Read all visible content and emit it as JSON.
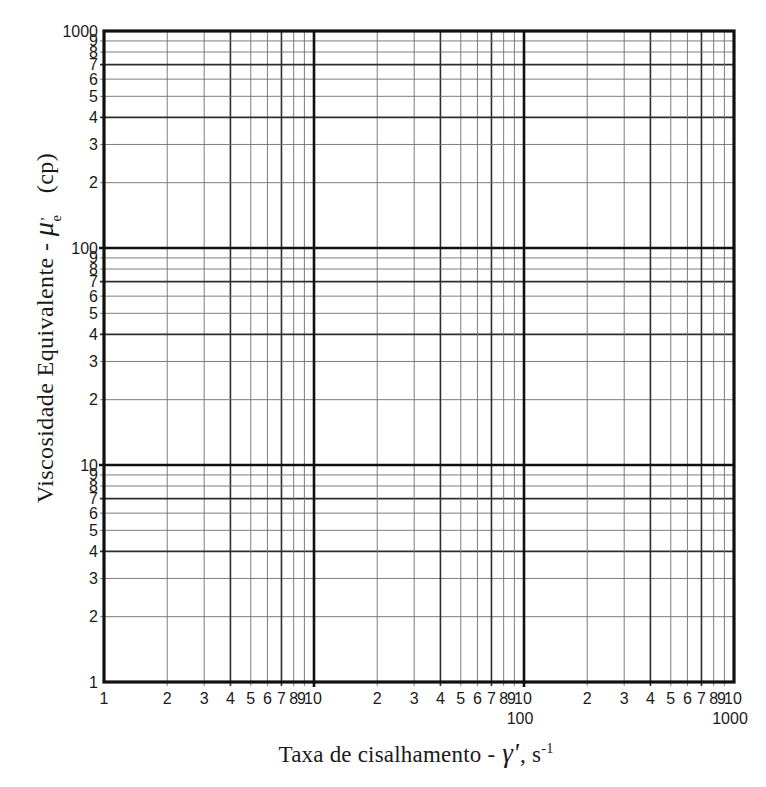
{
  "chart_data": {
    "type": "line",
    "title": "",
    "series": [],
    "x_axis": {
      "label_text": "Taxa de cisalhamento - ",
      "label_symbol": "γ'",
      "label_unit_base": ", s",
      "label_unit_exp": "-1",
      "scale": "log",
      "min": 1,
      "max": 1000,
      "decades": [
        1,
        10,
        100,
        1000
      ],
      "ticks": [
        {
          "label": "1",
          "value": 1
        },
        {
          "label": "2",
          "value": 2
        },
        {
          "label": "3",
          "value": 3
        },
        {
          "label": "4",
          "value": 4
        },
        {
          "label": "5",
          "value": 5
        },
        {
          "label": "6",
          "value": 6
        },
        {
          "label": "7",
          "value": 7
        },
        {
          "label": "8",
          "value": 8
        },
        {
          "label": "9",
          "value": 9
        },
        {
          "label": "10",
          "value": 10
        },
        {
          "label": "2",
          "value": 20
        },
        {
          "label": "3",
          "value": 30
        },
        {
          "label": "4",
          "value": 40
        },
        {
          "label": "5",
          "value": 50
        },
        {
          "label": "6",
          "value": 60
        },
        {
          "label": "7",
          "value": 70
        },
        {
          "label": "8",
          "value": 80
        },
        {
          "label": "9",
          "value": 90
        },
        {
          "label": "10",
          "value": 100
        },
        {
          "label": "2",
          "value": 200
        },
        {
          "label": "3",
          "value": 300
        },
        {
          "label": "4",
          "value": 400
        },
        {
          "label": "5",
          "value": 500
        },
        {
          "label": "6",
          "value": 600
        },
        {
          "label": "7",
          "value": 700
        },
        {
          "label": "8",
          "value": 800
        },
        {
          "label": "9",
          "value": 900
        },
        {
          "label": "10",
          "value": 1000
        }
      ],
      "secondary_labels": [
        {
          "label": "100",
          "value": 100
        },
        {
          "label": "1000",
          "value": 1000
        }
      ]
    },
    "y_axis": {
      "label_text": "Viscosidade Equivalente - ",
      "label_symbol": "μ",
      "label_symbol_sup": "’",
      "label_symbol_sub": "e",
      "label_unit": "(cp)",
      "scale": "log",
      "min": 1,
      "max": 1000,
      "decades": [
        1,
        10,
        100,
        1000
      ],
      "ticks": [
        {
          "label": "1000",
          "value": 1000
        },
        {
          "label": "9",
          "value": 900
        },
        {
          "label": "8",
          "value": 800
        },
        {
          "label": "7",
          "value": 700
        },
        {
          "label": "6",
          "value": 600
        },
        {
          "label": "5",
          "value": 500
        },
        {
          "label": "4",
          "value": 400
        },
        {
          "label": "3",
          "value": 300
        },
        {
          "label": "2",
          "value": 200
        },
        {
          "label": "100",
          "value": 100
        },
        {
          "label": "9",
          "value": 90
        },
        {
          "label": "8",
          "value": 80
        },
        {
          "label": "7",
          "value": 70
        },
        {
          "label": "6",
          "value": 60
        },
        {
          "label": "5",
          "value": 50
        },
        {
          "label": "4",
          "value": 40
        },
        {
          "label": "3",
          "value": 30
        },
        {
          "label": "2",
          "value": 20
        },
        {
          "label": "10",
          "value": 10
        },
        {
          "label": "9",
          "value": 9
        },
        {
          "label": "8",
          "value": 8
        },
        {
          "label": "7",
          "value": 7
        },
        {
          "label": "6",
          "value": 6
        },
        {
          "label": "5",
          "value": 5
        },
        {
          "label": "4",
          "value": 4
        },
        {
          "label": "3",
          "value": 3
        },
        {
          "label": "2",
          "value": 2
        },
        {
          "label": "1",
          "value": 1
        }
      ]
    },
    "grid": {
      "on": true,
      "minor_multipliers": [
        2,
        3,
        4,
        5,
        6,
        7,
        8,
        9
      ],
      "emphasis_multipliers": [
        4,
        7
      ]
    },
    "colors": {
      "background": "#ffffff",
      "text": "#1a1a1a",
      "line_major": "#101010",
      "line_medium": "#2e2e2e",
      "line_minor": "#6e6e6e"
    }
  }
}
